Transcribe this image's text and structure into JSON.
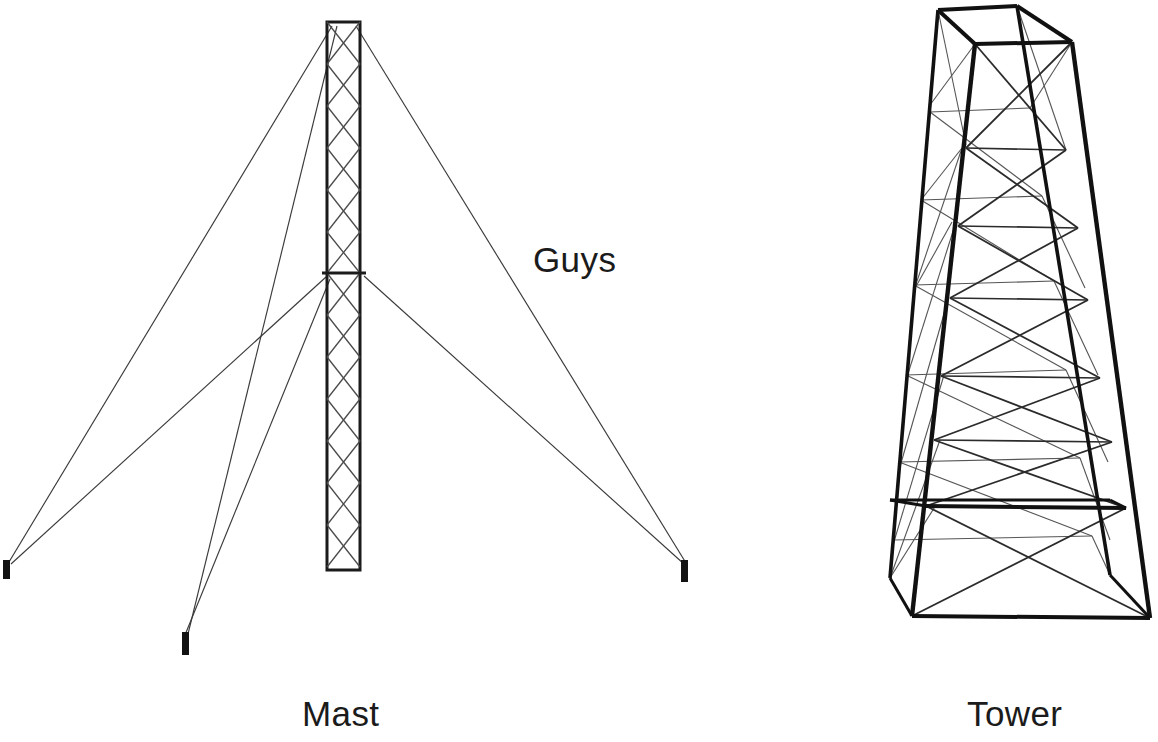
{
  "figure": {
    "background_color": "#ffffff",
    "ink_color": "#1b1b1b",
    "thin_line_color": "#3a3a3a",
    "canvas": {
      "width": 1158,
      "height": 742
    }
  },
  "labels": {
    "mast": "Mast",
    "tower": "Tower",
    "guys": "Guys"
  },
  "mast": {
    "name": "guyed-mast",
    "shaft": {
      "left": 327,
      "right": 360,
      "top": 22,
      "bottom": 570,
      "outline_width": 3,
      "lattice_pattern": "diamond-x-bracing",
      "panel_count": 13
    },
    "crossbar": {
      "y": 273,
      "left": 322,
      "right": 366,
      "width": 3
    },
    "anchors": [
      {
        "name": "anchor-left",
        "x": 6,
        "y_top": 560,
        "y_bottom": 579,
        "width": 7
      },
      {
        "name": "anchor-center",
        "x": 185,
        "y_top": 632,
        "y_bottom": 655,
        "width": 7
      },
      {
        "name": "anchor-right",
        "x": 683,
        "y_top": 560,
        "y_bottom": 582,
        "width": 7
      }
    ],
    "guy_lines": [
      {
        "name": "guy-top-left",
        "x1": 332,
        "y1": 26,
        "x2": 9,
        "y2": 562
      },
      {
        "name": "guy-top-left-lower",
        "x1": 336,
        "y1": 26,
        "x2": 188,
        "y2": 634
      },
      {
        "name": "guy-mid-left",
        "x1": 326,
        "y1": 276,
        "x2": 10,
        "y2": 563
      },
      {
        "name": "guy-mid-left-lower",
        "x1": 330,
        "y1": 278,
        "x2": 186,
        "y2": 634
      },
      {
        "name": "guy-top-right",
        "x1": 355,
        "y1": 26,
        "x2": 687,
        "y2": 562
      },
      {
        "name": "guy-mid-right",
        "x1": 363,
        "y1": 275,
        "x2": 685,
        "y2": 563
      }
    ]
  },
  "tower": {
    "name": "self-supporting-lattice-tower",
    "projection": "3d-perspective",
    "leg_count": 4,
    "legs": [
      {
        "name": "leg-back-left",
        "x_top": 938,
        "y_top": 10,
        "x_bottom": 890,
        "y_bottom": 578
      },
      {
        "name": "leg-front-left",
        "x_top": 975,
        "y_top": 44,
        "x_bottom": 912,
        "y_bottom": 616
      },
      {
        "name": "leg-front-right",
        "x_top": 1072,
        "y_top": 42,
        "x_bottom": 1150,
        "y_bottom": 618
      },
      {
        "name": "leg-back-right",
        "x_top": 1017,
        "y_top": 6,
        "x_bottom": 1110,
        "y_bottom": 575
      }
    ],
    "horizontal_levels": [
      {
        "name": "level-top",
        "y_front": 44,
        "bold": true
      },
      {
        "name": "level-2",
        "y_front": 150,
        "bold": false
      },
      {
        "name": "level-3",
        "y_front": 222,
        "bold": false
      },
      {
        "name": "level-4",
        "y_front": 295,
        "bold": false
      },
      {
        "name": "level-5",
        "y_front": 370,
        "bold": false
      },
      {
        "name": "level-6",
        "y_front": 430,
        "bold": false
      },
      {
        "name": "level-7",
        "y_front": 500,
        "bold": true
      },
      {
        "name": "level-base",
        "y_front": 616,
        "bold": true
      }
    ],
    "bracing": "x-diagonal-cross-bracing-between-levels",
    "base": {
      "left": 912,
      "right": 1150,
      "y": 616,
      "bold": true
    }
  }
}
